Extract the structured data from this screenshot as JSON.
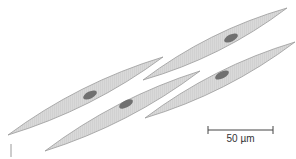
{
  "diagram": {
    "cells": [
      {
        "id": "cell-1",
        "tipA": [
          8,
          135
        ],
        "tipB": [
          163,
          57
        ],
        "nucleus": [
          90,
          95
        ],
        "width": 15
      },
      {
        "id": "cell-2",
        "tipA": [
          143,
          80
        ],
        "tipB": [
          287,
          8
        ],
        "nucleus": [
          231,
          38
        ],
        "width": 15
      },
      {
        "id": "cell-3",
        "tipA": [
          45,
          151
        ],
        "tipB": [
          200,
          71
        ],
        "nucleus": [
          126,
          104
        ],
        "width": 15
      },
      {
        "id": "cell-4",
        "tipA": [
          145,
          118
        ],
        "tipB": [
          295,
          42
        ],
        "nucleus": [
          222,
          75
        ],
        "width": 15
      }
    ],
    "colors": {
      "cell_fill": "#d9d9d9",
      "cell_outline": "#9a9a9a",
      "striation": "#bdbdbd",
      "nucleus": "#707070",
      "scale_bar": "#444444"
    }
  },
  "scale_bar": {
    "label": "50 µm",
    "x1": 208,
    "x2": 273,
    "y": 130
  }
}
